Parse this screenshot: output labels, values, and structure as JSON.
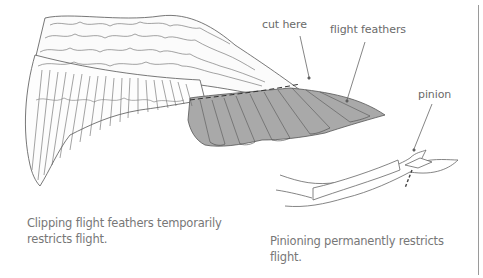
{
  "figure": {
    "panels": [
      {
        "id": "clipping",
        "illustration": "wing-with-clipped-flight-feathers",
        "labels": {
          "cut_here": "cut here",
          "flight_feathers": "flight feathers"
        },
        "caption_line1": "Clipping flight feathers temporarily",
        "caption_line2": "restricts flight."
      },
      {
        "id": "pinioning",
        "illustration": "pinioned-wing-bones",
        "labels": {
          "pinion": "pinion"
        },
        "caption_line1": "Pinioning permanently restricts",
        "caption_line2": "flight."
      }
    ],
    "colors": {
      "line": "#555555",
      "flight_feather_fill": "#a9a9a9",
      "label_text": "#6a6a6a",
      "caption_text": "#777777",
      "divider": "#9a9a9a"
    }
  }
}
